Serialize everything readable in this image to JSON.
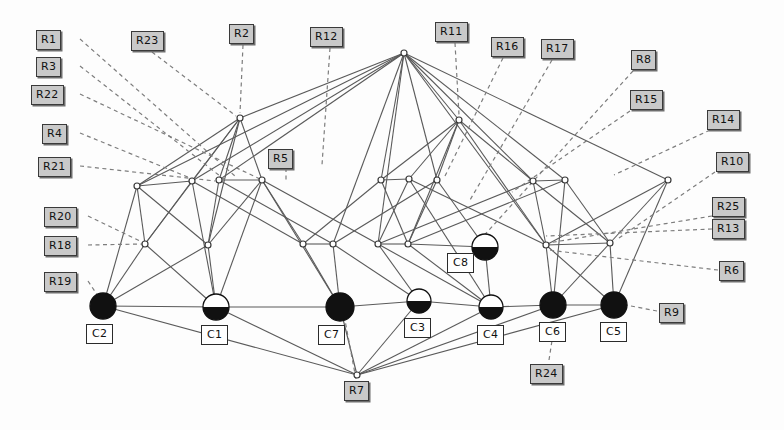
{
  "figure": {
    "kind": "bipartite-network-diagram",
    "background": "#fdfdfd",
    "edge_color": "#5a5a5a",
    "dashed_leader_color": "#7d7d7d",
    "node_fill_dark": "#111111",
    "node_fill_light": "#ffffff",
    "rlabel_fill": "#c9c9c9",
    "clabel_fill": "#ffffff",
    "width": 784,
    "height": 430
  },
  "r_labels": [
    {
      "id": "R1",
      "text": "R1",
      "x": 36,
      "y": 30
    },
    {
      "id": "R3",
      "text": "R3",
      "x": 36,
      "y": 57
    },
    {
      "id": "R22",
      "text": "R22",
      "x": 31,
      "y": 85
    },
    {
      "id": "R4",
      "text": "R4",
      "x": 42,
      "y": 124
    },
    {
      "id": "R21",
      "text": "R21",
      "x": 38,
      "y": 157
    },
    {
      "id": "R20",
      "text": "R20",
      "x": 44,
      "y": 207
    },
    {
      "id": "R18",
      "text": "R18",
      "x": 44,
      "y": 236
    },
    {
      "id": "R19",
      "text": "R19",
      "x": 44,
      "y": 272
    },
    {
      "id": "R23",
      "text": "R23",
      "x": 131,
      "y": 31
    },
    {
      "id": "R2",
      "text": "R2",
      "x": 229,
      "y": 24
    },
    {
      "id": "R12",
      "text": "R12",
      "x": 310,
      "y": 27
    },
    {
      "id": "R11",
      "text": "R11",
      "x": 435,
      "y": 22
    },
    {
      "id": "R16",
      "text": "R16",
      "x": 491,
      "y": 37
    },
    {
      "id": "R17",
      "text": "R17",
      "x": 541,
      "y": 39
    },
    {
      "id": "R8",
      "text": "R8",
      "x": 631,
      "y": 50
    },
    {
      "id": "R15",
      "text": "R15",
      "x": 630,
      "y": 90
    },
    {
      "id": "R14",
      "text": "R14",
      "x": 707,
      "y": 110
    },
    {
      "id": "R10",
      "text": "R10",
      "x": 716,
      "y": 152
    },
    {
      "id": "R25",
      "text": "R25",
      "x": 712,
      "y": 197
    },
    {
      "id": "R13",
      "text": "R13",
      "x": 712,
      "y": 219
    },
    {
      "id": "R6",
      "text": "R6",
      "x": 719,
      "y": 261
    },
    {
      "id": "R9",
      "text": "R9",
      "x": 659,
      "y": 303
    },
    {
      "id": "R5",
      "text": "R5",
      "x": 268,
      "y": 149
    },
    {
      "id": "R7",
      "text": "R7",
      "x": 344,
      "y": 381
    },
    {
      "id": "R24",
      "text": "R24",
      "x": 530,
      "y": 364
    }
  ],
  "c_labels": [
    {
      "id": "C2",
      "text": "C2",
      "x": 86,
      "y": 324
    },
    {
      "id": "C1",
      "text": "C1",
      "x": 201,
      "y": 325
    },
    {
      "id": "C7",
      "text": "C7",
      "x": 318,
      "y": 325
    },
    {
      "id": "C3",
      "text": "C3",
      "x": 404,
      "y": 318
    },
    {
      "id": "C4",
      "text": "C4",
      "x": 477,
      "y": 325
    },
    {
      "id": "C6",
      "text": "C6",
      "x": 539,
      "y": 322
    },
    {
      "id": "C5",
      "text": "C5",
      "x": 600,
      "y": 322
    },
    {
      "id": "C8",
      "text": "C8",
      "x": 447,
      "y": 253
    }
  ],
  "c_nodes": [
    {
      "id": "C2",
      "cx": 103,
      "cy": 306,
      "r": 13,
      "fill": "dark"
    },
    {
      "id": "C1",
      "cx": 216,
      "cy": 307,
      "r": 13,
      "fill": "half"
    },
    {
      "id": "C7",
      "cx": 340,
      "cy": 307,
      "r": 14,
      "fill": "dark"
    },
    {
      "id": "C3",
      "cx": 419,
      "cy": 301,
      "r": 12,
      "fill": "half"
    },
    {
      "id": "C4",
      "cx": 491,
      "cy": 307,
      "r": 12,
      "fill": "half"
    },
    {
      "id": "C6",
      "cx": 553,
      "cy": 305,
      "r": 13,
      "fill": "dark"
    },
    {
      "id": "C5",
      "cx": 614,
      "cy": 305,
      "r": 13,
      "fill": "dark"
    },
    {
      "id": "C8",
      "cx": 485,
      "cy": 247,
      "r": 13,
      "fill": "half"
    }
  ],
  "inner_nodes": [
    {
      "id": "T1",
      "cx": 404,
      "cy": 53
    },
    {
      "id": "U1",
      "cx": 240,
      "cy": 118
    },
    {
      "id": "U2",
      "cx": 459,
      "cy": 120
    },
    {
      "id": "M1",
      "cx": 137,
      "cy": 186
    },
    {
      "id": "M2",
      "cx": 192,
      "cy": 181
    },
    {
      "id": "M3",
      "cx": 219,
      "cy": 180
    },
    {
      "id": "M4",
      "cx": 262,
      "cy": 180
    },
    {
      "id": "M5",
      "cx": 381,
      "cy": 180
    },
    {
      "id": "M6",
      "cx": 409,
      "cy": 179
    },
    {
      "id": "M7",
      "cx": 437,
      "cy": 180
    },
    {
      "id": "M8",
      "cx": 533,
      "cy": 181
    },
    {
      "id": "M9",
      "cx": 565,
      "cy": 180
    },
    {
      "id": "M10",
      "cx": 668,
      "cy": 180
    },
    {
      "id": "L1",
      "cx": 145,
      "cy": 244
    },
    {
      "id": "L2",
      "cx": 208,
      "cy": 245
    },
    {
      "id": "L3",
      "cx": 303,
      "cy": 244
    },
    {
      "id": "L4",
      "cx": 333,
      "cy": 244
    },
    {
      "id": "L5",
      "cx": 378,
      "cy": 244
    },
    {
      "id": "L6",
      "cx": 408,
      "cy": 244
    },
    {
      "id": "L7",
      "cx": 546,
      "cy": 245
    },
    {
      "id": "L8",
      "cx": 610,
      "cy": 243
    },
    {
      "id": "B1",
      "cx": 357,
      "cy": 375
    }
  ],
  "edges": [
    [
      "T1",
      "U1"
    ],
    [
      "T1",
      "U2"
    ],
    [
      "T1",
      "M1"
    ],
    [
      "T1",
      "M2"
    ],
    [
      "T1",
      "M3"
    ],
    [
      "T1",
      "M5"
    ],
    [
      "T1",
      "M7"
    ],
    [
      "T1",
      "M8"
    ],
    [
      "T1",
      "M9"
    ],
    [
      "T1",
      "M10"
    ],
    [
      "T1",
      "L4"
    ],
    [
      "T1",
      "L5"
    ],
    [
      "T1",
      "L7"
    ],
    [
      "U1",
      "M1"
    ],
    [
      "U1",
      "M2"
    ],
    [
      "U1",
      "M3"
    ],
    [
      "U1",
      "L1"
    ],
    [
      "U1",
      "L2"
    ],
    [
      "U2",
      "M5"
    ],
    [
      "U2",
      "M7"
    ],
    [
      "U2",
      "M8"
    ],
    [
      "U2",
      "L6"
    ],
    [
      "U2",
      "L7"
    ],
    [
      "M1",
      "L1"
    ],
    [
      "M1",
      "L2"
    ],
    [
      "M1",
      "C2"
    ],
    [
      "M2",
      "L1"
    ],
    [
      "M2",
      "L3"
    ],
    [
      "M3",
      "L2"
    ],
    [
      "M3",
      "L4"
    ],
    [
      "M4",
      "L2"
    ],
    [
      "M4",
      "L3"
    ],
    [
      "M4",
      "L5"
    ],
    [
      "M4",
      "C1"
    ],
    [
      "M5",
      "L3"
    ],
    [
      "M5",
      "L6"
    ],
    [
      "M6",
      "L5"
    ],
    [
      "M6",
      "L7"
    ],
    [
      "M7",
      "L4"
    ],
    [
      "M7",
      "L6"
    ],
    [
      "M7",
      "C8"
    ],
    [
      "M8",
      "L5"
    ],
    [
      "M8",
      "L7"
    ],
    [
      "M8",
      "L8"
    ],
    [
      "M9",
      "L6"
    ],
    [
      "M9",
      "L8"
    ],
    [
      "M10",
      "L7"
    ],
    [
      "M10",
      "L8"
    ],
    [
      "L1",
      "C2"
    ],
    [
      "L1",
      "C1"
    ],
    [
      "L2",
      "C1"
    ],
    [
      "L3",
      "C7"
    ],
    [
      "L4",
      "C7"
    ],
    [
      "L4",
      "C3"
    ],
    [
      "L5",
      "C4"
    ],
    [
      "L5",
      "C3"
    ],
    [
      "L6",
      "C8"
    ],
    [
      "L6",
      "C4"
    ],
    [
      "L7",
      "C6"
    ],
    [
      "L7",
      "C5"
    ],
    [
      "L8",
      "C5"
    ],
    [
      "L8",
      "C6"
    ],
    [
      "C8",
      "C4"
    ],
    [
      "C2",
      "B1"
    ],
    [
      "C1",
      "B1"
    ],
    [
      "C7",
      "B1"
    ],
    [
      "C3",
      "B1"
    ],
    [
      "C4",
      "B1"
    ],
    [
      "C2",
      "C1"
    ],
    [
      "C1",
      "C7"
    ],
    [
      "C7",
      "C3"
    ],
    [
      "C3",
      "C4"
    ],
    [
      "C4",
      "C6"
    ],
    [
      "C6",
      "C5"
    ],
    [
      "M1",
      "M2"
    ],
    [
      "M3",
      "M4"
    ],
    [
      "M5",
      "M6"
    ],
    [
      "M8",
      "M9"
    ],
    [
      "L3",
      "L4"
    ],
    [
      "L5",
      "L6"
    ],
    [
      "L7",
      "L8"
    ],
    [
      "M10",
      "C5"
    ],
    [
      "M2",
      "C1"
    ],
    [
      "M9",
      "C6"
    ],
    [
      "U1",
      "M4"
    ],
    [
      "U2",
      "M6"
    ],
    [
      "M4",
      "C7"
    ],
    [
      "M6",
      "C4"
    ],
    [
      "B1",
      "C6"
    ],
    [
      "B1",
      "C5"
    ],
    [
      "L2",
      "C2"
    ]
  ],
  "leaders": [
    {
      "r": "R1",
      "from": [
        80,
        39
      ],
      "to": [
        236,
        177
      ]
    },
    {
      "r": "R3",
      "from": [
        80,
        66
      ],
      "to": [
        225,
        180
      ]
    },
    {
      "r": "R22",
      "from": [
        80,
        94
      ],
      "to": [
        260,
        179
      ]
    },
    {
      "r": "R4",
      "from": [
        80,
        133
      ],
      "to": [
        195,
        180
      ]
    },
    {
      "r": "R21",
      "from": [
        80,
        166
      ],
      "to": [
        215,
        181
      ]
    },
    {
      "r": "R20",
      "from": [
        88,
        216
      ],
      "to": [
        142,
        242
      ]
    },
    {
      "r": "R18",
      "from": [
        88,
        245
      ],
      "to": [
        142,
        244
      ]
    },
    {
      "r": "R19",
      "from": [
        88,
        281
      ],
      "to": [
        98,
        296
      ]
    },
    {
      "r": "R23",
      "from": [
        152,
        52
      ],
      "to": [
        236,
        116
      ]
    },
    {
      "r": "R2",
      "from": [
        243,
        45
      ],
      "to": [
        240,
        113
      ]
    },
    {
      "r": "R12",
      "from": [
        330,
        48
      ],
      "to": [
        322,
        165
      ]
    },
    {
      "r": "R11",
      "from": [
        455,
        43
      ],
      "to": [
        459,
        115
      ]
    },
    {
      "r": "R16",
      "from": [
        503,
        58
      ],
      "to": [
        445,
        176
      ]
    },
    {
      "r": "R17",
      "from": [
        552,
        60
      ],
      "to": [
        470,
        200
      ]
    },
    {
      "r": "R8",
      "from": [
        633,
        71
      ],
      "to": [
        480,
        240
      ]
    },
    {
      "r": "R15",
      "from": [
        630,
        111
      ],
      "to": [
        512,
        192
      ]
    },
    {
      "r": "R14",
      "from": [
        710,
        130
      ],
      "to": [
        614,
        175
      ]
    },
    {
      "r": "R10",
      "from": [
        715,
        172
      ],
      "to": [
        616,
        240
      ]
    },
    {
      "r": "R25",
      "from": [
        712,
        216
      ],
      "to": [
        548,
        243
      ]
    },
    {
      "r": "R13",
      "from": [
        712,
        229
      ],
      "to": [
        546,
        236
      ]
    },
    {
      "r": "R6",
      "from": [
        718,
        270
      ],
      "to": [
        548,
        250
      ]
    },
    {
      "r": "R9",
      "from": [
        657,
        311
      ],
      "to": [
        626,
        305
      ]
    },
    {
      "r": "R5",
      "from": [
        286,
        168
      ],
      "to": [
        286,
        180
      ]
    },
    {
      "r": "R7",
      "from": [
        356,
        379
      ],
      "to": [
        344,
        315
      ]
    },
    {
      "r": "R24",
      "from": [
        549,
        360
      ],
      "to": [
        553,
        334
      ]
    }
  ]
}
